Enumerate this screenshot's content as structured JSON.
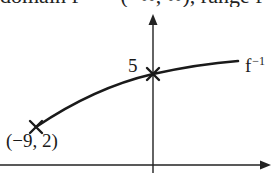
{
  "header_clipped_text": "domain f⁻¹ = (−∞, ∞), range f⁻¹ (",
  "graph": {
    "y_intercept_label": "5",
    "start_point_label": "(−9, 2)",
    "curve_label_base": "f",
    "curve_label_superscript": "−1",
    "curve_color": "#1a1a1a",
    "axes_color": "#222222",
    "markers": [
      {
        "name": "start-point-marker",
        "coords": "(-9, 2)"
      },
      {
        "name": "y-intercept-marker",
        "coords": "(0, 5)"
      }
    ]
  }
}
